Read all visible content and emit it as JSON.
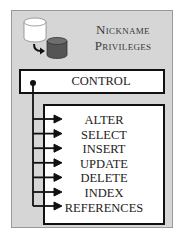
{
  "diagram": {
    "title_line1": "Nickname",
    "title_line2": "Privileges",
    "icon": "database-copy-icon",
    "control": {
      "label": "CONTROL"
    },
    "privileges": [
      {
        "label": "ALTER"
      },
      {
        "label": "SELECT"
      },
      {
        "label": "INSERT"
      },
      {
        "label": "UPDATE"
      },
      {
        "label": "DELETE"
      },
      {
        "label": "INDEX"
      },
      {
        "label": "REFERENCES"
      }
    ],
    "colors": {
      "panel_background": "#d6d6d6",
      "box_background": "#ffffff",
      "line_color": "#111111",
      "title_text": "#3a3a3a"
    }
  }
}
